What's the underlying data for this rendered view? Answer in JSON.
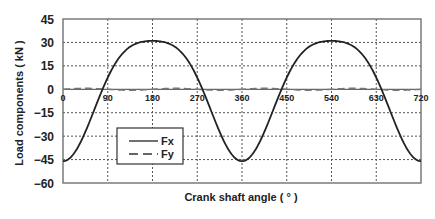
{
  "chart_data": {
    "type": "line",
    "title": "",
    "xlabel": "Crank shaft angle ( ° )",
    "ylabel": "Load components ( kN )",
    "xlim": [
      0,
      720
    ],
    "ylim": [
      -60,
      45
    ],
    "x_ticks": [
      0,
      90,
      180,
      270,
      360,
      450,
      540,
      630,
      720
    ],
    "y_ticks": [
      45,
      30,
      15,
      0,
      -15,
      -30,
      -45,
      -60
    ],
    "x_tick_labels": [
      "0",
      "90",
      "180",
      "270",
      "360",
      "450",
      "540",
      "630",
      "720"
    ],
    "y_tick_labels": [
      "45",
      "30",
      "15",
      "0",
      "-15",
      "-30",
      "-45",
      "-60"
    ],
    "grid": true,
    "grid_style": "dotted",
    "legend": {
      "position": "lower-left inside plot",
      "entries": [
        "Fx",
        "Fy"
      ]
    },
    "x": [
      0,
      30,
      60,
      80,
      90,
      120,
      150,
      180,
      210,
      240,
      270,
      280,
      300,
      330,
      360,
      390,
      420,
      440,
      450,
      480,
      510,
      540,
      570,
      600,
      630,
      640,
      660,
      690,
      720
    ],
    "series": [
      {
        "name": "Fx",
        "style": "solid",
        "color": "#222222",
        "values": [
          -46.0,
          -37.1,
          -15.5,
          -0.1,
          7.5,
          22.7,
          29.6,
          31.0,
          29.6,
          22.7,
          7.5,
          0.0,
          -15.5,
          -37.1,
          -46.0,
          -37.1,
          -15.5,
          -0.1,
          7.5,
          22.7,
          29.6,
          31.0,
          29.6,
          22.7,
          7.5,
          0.0,
          -15.5,
          -37.1,
          -46.0
        ]
      },
      {
        "name": "Fy",
        "style": "dashed",
        "color": "#666666",
        "values": [
          0.0,
          0.5,
          0.8,
          0.7,
          0.6,
          0.2,
          -0.3,
          -0.5,
          -0.6,
          -0.5,
          -0.2,
          -0.1,
          0.3,
          0.5,
          0.0,
          0.5,
          0.8,
          0.7,
          0.6,
          0.2,
          -0.3,
          -0.5,
          -0.6,
          -0.5,
          -0.2,
          -0.1,
          0.3,
          0.5,
          0.0
        ]
      }
    ]
  },
  "colors": {
    "background": "#ffffff",
    "frame": "#666666",
    "grid": "#555555",
    "fx_line": "#222222",
    "fy_line": "#777777",
    "text": "#222222"
  }
}
